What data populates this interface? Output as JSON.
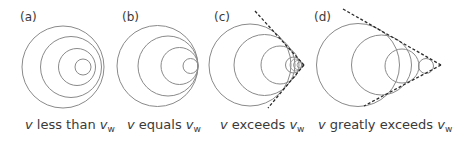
{
  "figure": {
    "panels": [
      {
        "id": "a",
        "label": "(a)",
        "caption": {
          "var": "v",
          "text": " less than ",
          "var2": "v",
          "sub": "w"
        },
        "regime": "subsonic",
        "wavefront_count": 4,
        "shock_cone": false
      },
      {
        "id": "b",
        "label": "(b)",
        "caption": {
          "var": "v",
          "text": " equals ",
          "var2": "v",
          "sub": "w"
        },
        "regime": "sonic",
        "wavefront_count": 4,
        "shock_cone": false
      },
      {
        "id": "c",
        "label": "(c)",
        "caption": {
          "var": "v",
          "text": " exceeds ",
          "var2": "v",
          "sub": "w"
        },
        "regime": "supersonic",
        "wavefront_count": 4,
        "shock_cone": true
      },
      {
        "id": "d",
        "label": "(d)",
        "caption": {
          "var": "v",
          "text": " greatly exceeds ",
          "var2": "v",
          "sub": "w"
        },
        "regime": "hypersonic",
        "wavefront_count": 4,
        "shock_cone": true
      }
    ]
  }
}
